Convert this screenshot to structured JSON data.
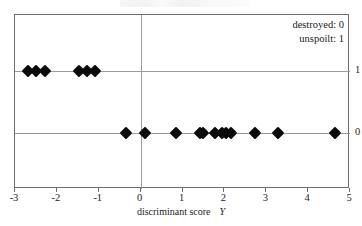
{
  "figure": {
    "title_remnant": "",
    "background": "#ffffff",
    "marker_color": "#0a0a0a",
    "frame_color": "#6d6d6d",
    "grid_color": "#9a9a9a"
  },
  "legend": {
    "position": "top-right",
    "entries": [
      {
        "label": "destroyed: 0"
      },
      {
        "label": "unspoilt: 1"
      }
    ]
  },
  "axes": {
    "x_title_text": "discriminant score",
    "x_title_variable": "Y",
    "x_ticks": [
      "-3",
      "-2",
      "-1",
      "0",
      "1",
      "2",
      "3",
      "4",
      "5"
    ],
    "y_ticks": [
      "1",
      "0"
    ],
    "y_tick_side": "right"
  },
  "chart_data": {
    "type": "scatter",
    "title": "",
    "xlabel": "discriminant score  Y",
    "ylabel": "",
    "xlim": [
      -3,
      5
    ],
    "ylim": [
      -0.35,
      1.45
    ],
    "grid": true,
    "legend_position": "top-right",
    "xticks": [
      -3,
      -2,
      -1,
      0,
      1,
      2,
      3,
      4,
      5
    ],
    "yticks": [
      0,
      1
    ],
    "ytick_labels": [
      "0",
      "1"
    ],
    "marker": "diamond",
    "marker_color": "#0a0a0a",
    "series": [
      {
        "name": "unspoilt: 1",
        "y": 1,
        "n": 6,
        "x": [
          -2.69,
          -2.5,
          -2.28,
          -1.47,
          -1.28,
          -1.09
        ],
        "points": [
          {
            "x": -2.69,
            "y": 1
          },
          {
            "x": -2.5,
            "y": 1
          },
          {
            "x": -2.28,
            "y": 1
          },
          {
            "x": -1.47,
            "y": 1
          },
          {
            "x": -1.28,
            "y": 1
          },
          {
            "x": -1.09,
            "y": 1
          }
        ]
      },
      {
        "name": "destroyed: 0",
        "y": 0,
        "n": 14,
        "x": [
          -0.35,
          0.1,
          0.85,
          1.42,
          1.48,
          1.78,
          1.95,
          2.03,
          2.17,
          2.73,
          3.28,
          4.63
        ],
        "points": [
          {
            "x": -0.35,
            "y": 0
          },
          {
            "x": 0.1,
            "y": 0
          },
          {
            "x": 0.85,
            "y": 0
          },
          {
            "x": 1.42,
            "y": 0
          },
          {
            "x": 1.48,
            "y": 0
          },
          {
            "x": 1.78,
            "y": 0
          },
          {
            "x": 1.95,
            "y": 0
          },
          {
            "x": 2.03,
            "y": 0
          },
          {
            "x": 2.17,
            "y": 0
          },
          {
            "x": 2.73,
            "y": 0
          },
          {
            "x": 3.28,
            "y": 0
          },
          {
            "x": 4.63,
            "y": 0
          }
        ]
      }
    ]
  }
}
